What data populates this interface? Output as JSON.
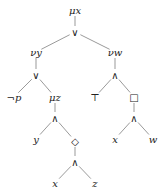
{
  "diagram": {
    "type": "syntax-tree",
    "nodes": [
      {
        "id": "n0",
        "label": "μx",
        "x": 75,
        "y": 10,
        "italic": true
      },
      {
        "id": "n1",
        "label": "∨",
        "x": 75,
        "y": 32,
        "italic": false
      },
      {
        "id": "n2",
        "label": "νy",
        "x": 36,
        "y": 52,
        "italic": true
      },
      {
        "id": "n3",
        "label": "νw",
        "x": 115,
        "y": 52,
        "italic": true
      },
      {
        "id": "n4",
        "label": "∨",
        "x": 36,
        "y": 75,
        "italic": false
      },
      {
        "id": "n5",
        "label": "∧",
        "x": 115,
        "y": 75,
        "italic": false
      },
      {
        "id": "n6",
        "label": "¬p",
        "x": 14,
        "y": 97,
        "italic": true
      },
      {
        "id": "n7",
        "label": "μz",
        "x": 55,
        "y": 97,
        "italic": true
      },
      {
        "id": "n8",
        "label": "⊤",
        "x": 95,
        "y": 97,
        "italic": false
      },
      {
        "id": "n9",
        "label": "□",
        "x": 134,
        "y": 97,
        "italic": false
      },
      {
        "id": "n10",
        "label": "∧",
        "x": 55,
        "y": 118,
        "italic": false
      },
      {
        "id": "n11",
        "label": "y",
        "x": 36,
        "y": 139,
        "italic": true
      },
      {
        "id": "n12",
        "label": "◇",
        "x": 75,
        "y": 141,
        "italic": false
      },
      {
        "id": "n13",
        "label": "∧",
        "x": 134,
        "y": 118,
        "italic": false
      },
      {
        "id": "n14",
        "label": "x",
        "x": 115,
        "y": 139,
        "italic": true
      },
      {
        "id": "n15",
        "label": "w",
        "x": 153,
        "y": 139,
        "italic": true
      },
      {
        "id": "n16",
        "label": "∧",
        "x": 75,
        "y": 162,
        "italic": false
      },
      {
        "id": "n17",
        "label": "x",
        "x": 55,
        "y": 183,
        "italic": true
      },
      {
        "id": "n18",
        "label": "z",
        "x": 95,
        "y": 183,
        "italic": true
      }
    ],
    "edges": [
      [
        "n0",
        "n1"
      ],
      [
        "n1",
        "n2"
      ],
      [
        "n1",
        "n3"
      ],
      [
        "n2",
        "n4"
      ],
      [
        "n3",
        "n5"
      ],
      [
        "n4",
        "n6"
      ],
      [
        "n4",
        "n7"
      ],
      [
        "n5",
        "n8"
      ],
      [
        "n5",
        "n9"
      ],
      [
        "n7",
        "n10"
      ],
      [
        "n10",
        "n11"
      ],
      [
        "n10",
        "n12"
      ],
      [
        "n9",
        "n13"
      ],
      [
        "n13",
        "n14"
      ],
      [
        "n13",
        "n15"
      ],
      [
        "n12",
        "n16"
      ],
      [
        "n16",
        "n17"
      ],
      [
        "n16",
        "n18"
      ]
    ]
  }
}
